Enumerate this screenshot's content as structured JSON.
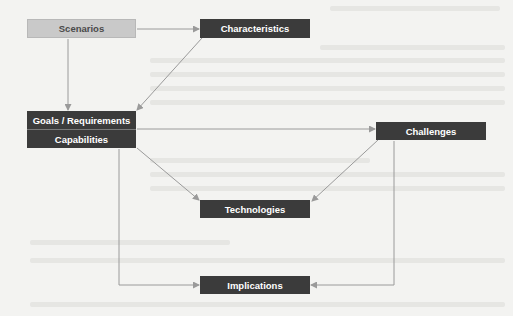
{
  "diagram": {
    "nodes": [
      {
        "id": "scenarios",
        "label": "Scenarios",
        "style": "light"
      },
      {
        "id": "characteristics",
        "label": "Characteristics",
        "style": "dark"
      },
      {
        "id": "goals",
        "label": "Goals / Requirements",
        "style": "dark"
      },
      {
        "id": "capabilities",
        "label": "Capabilities",
        "style": "dark"
      },
      {
        "id": "challenges",
        "label": "Challenges",
        "style": "dark"
      },
      {
        "id": "technologies",
        "label": "Technologies",
        "style": "dark"
      },
      {
        "id": "implications",
        "label": "Implications",
        "style": "dark"
      }
    ],
    "edges": [
      {
        "from": "scenarios",
        "to": "characteristics"
      },
      {
        "from": "scenarios",
        "to": "goals"
      },
      {
        "from": "characteristics",
        "to": "goals"
      },
      {
        "from": "goals",
        "to": "challenges"
      },
      {
        "from": "goals",
        "to": "technologies"
      },
      {
        "from": "challenges",
        "to": "technologies"
      },
      {
        "from": "capabilities",
        "to": "implications"
      },
      {
        "from": "challenges",
        "to": "implications"
      }
    ],
    "colors": {
      "dark_box": "#3b3b3b",
      "light_box": "#c9c9c9",
      "connector": "#9a9a9a",
      "background": "#f3f3f1"
    }
  }
}
